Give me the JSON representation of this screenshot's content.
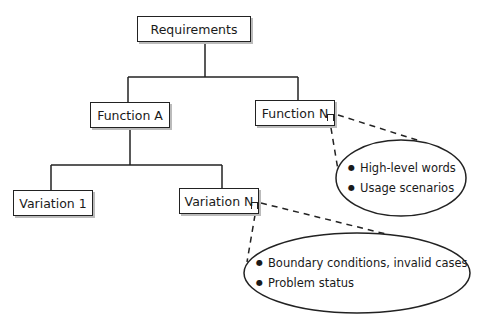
{
  "diagram": {
    "root": {
      "label": "Requirements"
    },
    "functions": [
      {
        "label": "Function A"
      },
      {
        "label": "Function N"
      }
    ],
    "variations": [
      {
        "label": "Variation 1"
      },
      {
        "label": "Variation N"
      }
    ],
    "annotations": [
      {
        "attached_to": "Function N",
        "items": [
          "High-level words",
          "Usage scenarios"
        ]
      },
      {
        "attached_to": "Variation N",
        "items": [
          "Boundary conditions, invalid cases",
          "Problem status"
        ]
      }
    ]
  }
}
